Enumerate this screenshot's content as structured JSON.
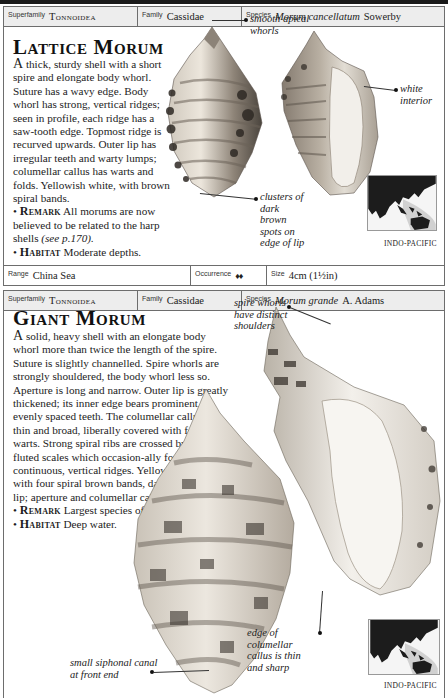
{
  "entries": [
    {
      "classification": {
        "superfamily_label": "Superfamily",
        "superfamily": "Tonnoidea",
        "family_label": "Family",
        "family": "Cassidae",
        "species_label": "Species",
        "species_name": "Morum cancellatum",
        "species_author": "Sowerby"
      },
      "title": "Lattice Morum",
      "description_first_letter": "A",
      "description": " thick, sturdy shell with a short spire and elongate body whorl. Suture has a wavy edge. Body whorl has strong, vertical ridges; seen in profile, each ridge has a saw-tooth edge. Topmost ridge is recurved upwards. Outer lip has irregular teeth and warty lumps; columellar callus has warts and folds. Yellowish white, with brown spiral bands.",
      "remark_label": "Remark",
      "remark_text": " All morums are now believed to be related to the harp shells ",
      "remark_ref": "(see p.170).",
      "habitat_label": "Habitat",
      "habitat_text": " Moderate depths.",
      "annotations": [
        {
          "text": "smooth apical whorls"
        },
        {
          "text": "white interior"
        },
        {
          "text": "clusters of dark brown spots on edge of lip"
        }
      ],
      "map_label": "INDO-PACIFIC",
      "footer": {
        "range_label": "Range",
        "range": "China Sea",
        "occurrence_label": "Occurrence",
        "occurrence_icon": "shell-pair-icon",
        "occurrence_glyph": "♦♦",
        "size_label": "Size",
        "size": "4cm (1½in)"
      }
    },
    {
      "classification": {
        "superfamily_label": "Superfamily",
        "superfamily": "Tonnoidea",
        "family_label": "Family",
        "family": "Cassidae",
        "species_label": "Species",
        "species_name": "Morum grande",
        "species_author": "A. Adams"
      },
      "title": "Giant Morum",
      "description_first_letter": "A",
      "description": " solid, heavy shell with an elongate body whorl more than twice the length of the spire. Suture is slightly channelled. Spire whorls are strongly shouldered, the body whorl less so. Aperture is long and narrow. Outer lip is greatly thickened; its inner edge bears prominent, evenly spaced teeth. The columellar callus is thin and broad, liberally covered with folds and warts. Strong spiral ribs are crossed by vertical, fluted scales which occasion-ally form continuous, vertical ridges. Yellowish white, with four spiral brown bands, darker on outer lip; aperture and columellar callus both white.",
      "remark_label": "Remark",
      "remark_text": " Largest species of genus.",
      "habitat_label": "Habitat",
      "habitat_text": " Deep water.",
      "annotations": [
        {
          "text": "spire whorls have distinct shoulders"
        },
        {
          "text": "small siphonal canal at front end"
        },
        {
          "text": "edge of columellar callus is thin and sharp"
        }
      ],
      "map_label": "INDO-PACIFIC"
    }
  ],
  "colors": {
    "border": "#6d6d6d",
    "header_bg": "#ededed",
    "text": "#1a1a1a",
    "map_land": "#1c1c1c",
    "map_sea": "#f5f5f5",
    "map_range": "#c8c8c8"
  }
}
